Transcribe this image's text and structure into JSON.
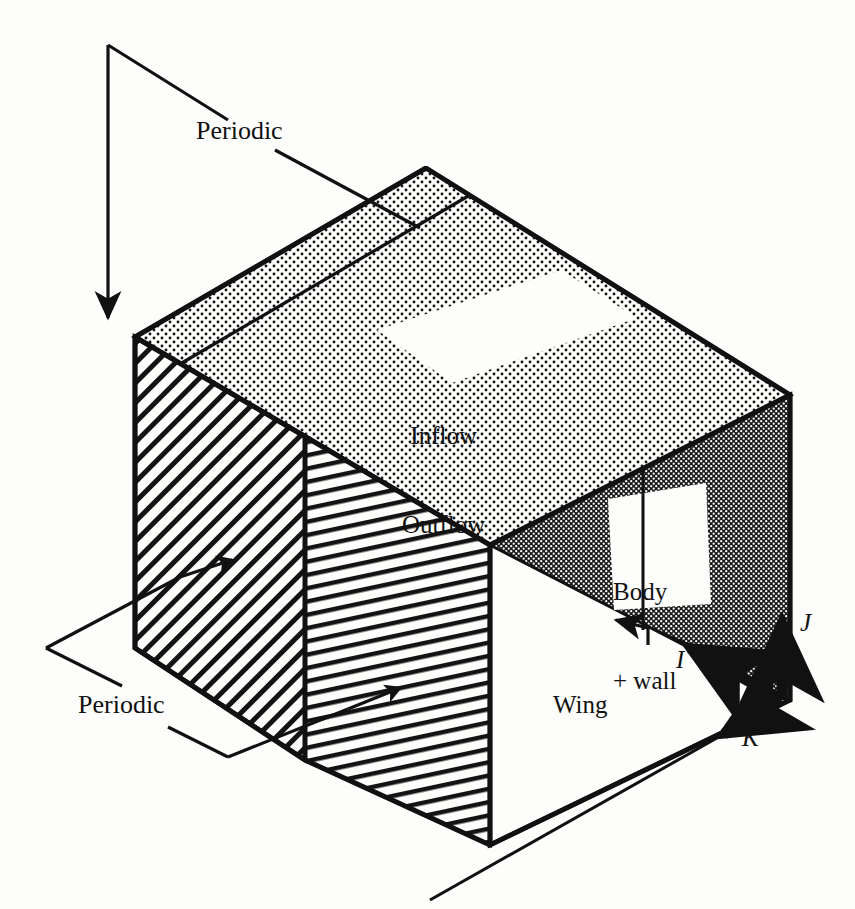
{
  "figure": {
    "type": "3d-block-diagram",
    "background_color": "#fdfdfb",
    "ink_color": "#111111"
  },
  "labels": {
    "periodic_top": "Periodic",
    "periodic_bottom": "Periodic",
    "inflow_outflow_line1": "Inflow",
    "inflow_outflow_line2": "Outflow",
    "body_line1": "Body",
    "body_line2": "+ wall",
    "wing": "Wing"
  },
  "axes": {
    "i": "I",
    "j": "J",
    "k": "K"
  },
  "faces": {
    "top": {
      "name": "top-face",
      "fill": "dotted-light",
      "boundary": "Inflow / Outflow"
    },
    "left": {
      "name": "left-face",
      "fill": "diagonal-hatch",
      "boundary": "Periodic"
    },
    "mid": {
      "name": "mid-face",
      "fill": "steep-hatch",
      "boundary": "Periodic"
    },
    "right": {
      "name": "right-face",
      "fill": "cross-hatch-dark",
      "boundary": "Body + wall"
    },
    "front": {
      "name": "front-face",
      "fill": "white",
      "boundary": "Wing"
    }
  },
  "geometry": {
    "top_back_vertex": [
      426,
      168
    ],
    "left_top_vertex": [
      135,
      337
    ],
    "right_back_vertex": [
      790,
      395
    ],
    "top_front_vertex": [
      490,
      545
    ],
    "left_bottom_vertex": [
      135,
      648
    ],
    "mid_edge_x": 305,
    "front_bottom_vertex": [
      490,
      845
    ],
    "right_bottom_vertex": [
      790,
      700
    ],
    "axis_origin": [
      782,
      700
    ]
  }
}
